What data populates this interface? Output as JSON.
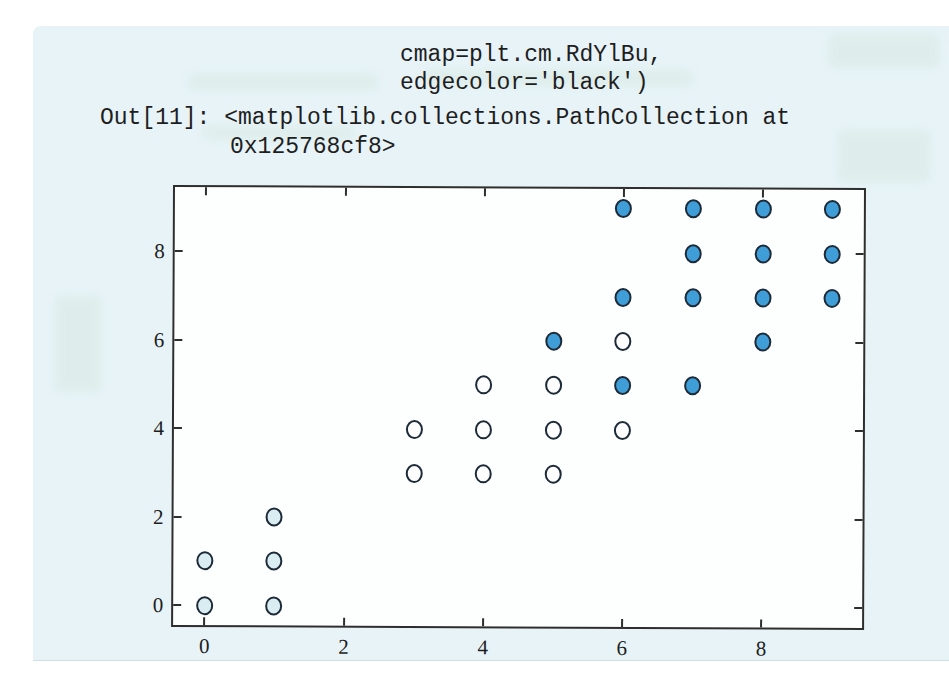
{
  "code_output": {
    "arg_line_1": "cmap=plt.cm.RdYlBu,",
    "arg_line_2": "edgecolor='black')",
    "out_label_and_result": "Out[11]: <matplotlib.collections.PathCollection at",
    "result_continuation": "0x125768cf8>"
  },
  "chart_data": {
    "type": "scatter",
    "title": "",
    "xlabel": "",
    "ylabel": "",
    "xlim": [
      -0.45,
      9.45
    ],
    "ylim": [
      -0.45,
      9.45
    ],
    "x_ticks": [
      0,
      2,
      4,
      6,
      8
    ],
    "y_ticks": [
      0,
      2,
      4,
      6,
      8
    ],
    "grid": false,
    "legend": "none",
    "marker": {
      "shape": "circle",
      "diameter_px": 17,
      "edge_color": "#1d2b38",
      "edge_width_px": 2
    },
    "series": [
      {
        "name": "low-cluster-pale-blue",
        "color": "#d9edf2",
        "points": [
          [
            0,
            0
          ],
          [
            1,
            0
          ],
          [
            0,
            1
          ],
          [
            1,
            1
          ],
          [
            1,
            2
          ]
        ]
      },
      {
        "name": "mid-cluster-white",
        "color": "#fdfdfd",
        "points": [
          [
            3,
            3
          ],
          [
            4,
            3
          ],
          [
            5,
            3
          ],
          [
            3,
            4
          ],
          [
            4,
            4
          ],
          [
            5,
            4
          ],
          [
            6,
            4
          ],
          [
            4,
            5
          ],
          [
            5,
            5
          ],
          [
            6,
            6
          ]
        ]
      },
      {
        "name": "high-cluster-blue",
        "color": "#3f9ed8",
        "points": [
          [
            6,
            5
          ],
          [
            7,
            5
          ],
          [
            5,
            6
          ],
          [
            8,
            6
          ],
          [
            6,
            7
          ],
          [
            7,
            7
          ],
          [
            8,
            7
          ],
          [
            9,
            7
          ],
          [
            7,
            8
          ],
          [
            8,
            8
          ],
          [
            9,
            8
          ],
          [
            6,
            9
          ],
          [
            7,
            9
          ],
          [
            8,
            9
          ],
          [
            9,
            9
          ]
        ]
      }
    ]
  },
  "colors": {
    "page_margin": "#ffffff",
    "paper": "#e7f3f7",
    "plot_background": "#fdfefe",
    "plot_border": "#2e2e2e",
    "text": "#1e1e1e"
  }
}
